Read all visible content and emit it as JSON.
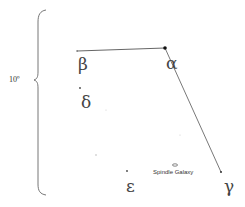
{
  "scale": {
    "label": "10º"
  },
  "stars": [
    {
      "id": "alpha",
      "symbol": "α",
      "x": 165,
      "y": 48
    },
    {
      "id": "beta",
      "symbol": "β",
      "x": 77,
      "y": 51
    },
    {
      "id": "gamma",
      "symbol": "γ",
      "x": 221,
      "y": 172
    },
    {
      "id": "delta",
      "symbol": "δ",
      "x": 80,
      "y": 88
    },
    {
      "id": "epsilon",
      "symbol": "ε",
      "x": 127,
      "y": 171
    }
  ],
  "labels": {
    "alpha": "α",
    "beta": "β",
    "gamma": "γ",
    "delta": "δ",
    "epsilon": "ε"
  },
  "galaxy": {
    "label": "Spindle Galaxy"
  },
  "colors": {
    "line": "#555555",
    "star": "#222222",
    "faint": "#bbbbbb"
  }
}
